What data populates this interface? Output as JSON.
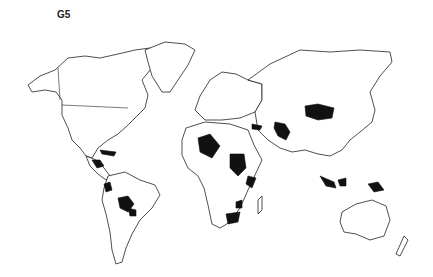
{
  "map": {
    "title": "G5",
    "highlight_color": "#111111",
    "base_color": "#ffffff",
    "outline_color": "#222222",
    "highlighted_regions": [
      "Guatemala/Honduras",
      "Haiti/Dominican Republic",
      "Ecuador",
      "Bolivia",
      "Paraguay",
      "Mali/Algeria (Sahel)",
      "Sudan",
      "Somalia",
      "Zimbabwe/Mozambique",
      "South Africa/Lesotho",
      "Syria/Iraq",
      "Afghanistan/Pakistan",
      "Mongolia",
      "Indonesia",
      "Papua New Guinea"
    ]
  }
}
